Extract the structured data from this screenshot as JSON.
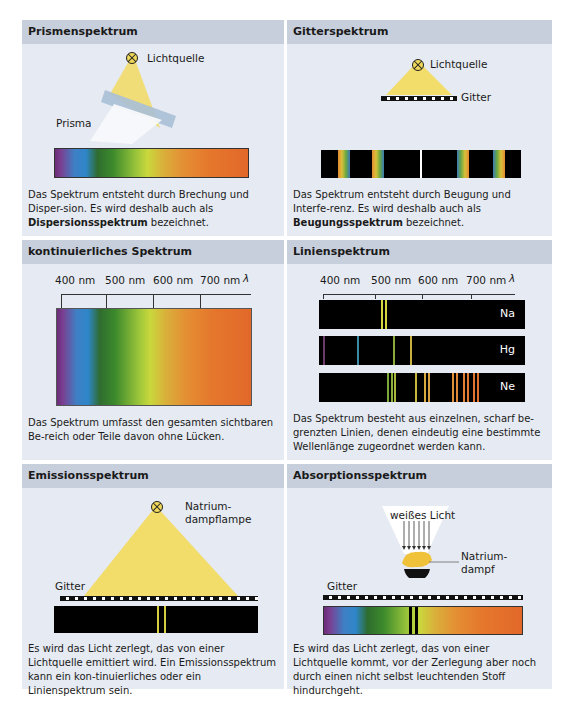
{
  "panels": {
    "prism": {
      "title": "Prismenspektrum",
      "light_label": "Lichtquelle",
      "prism_label": "Prisma",
      "desc_1": "Das Spektrum entsteht durch Brechung und Disper-sion. Es wird deshalb auch als ",
      "desc_bold": "Dispersionsspektrum",
      "desc_2": " bezeichnet."
    },
    "grating": {
      "title": "Gitterspektrum",
      "light_label": "Lichtquelle",
      "grating_label": "Gitter",
      "desc_1": "Das Spektrum entsteht durch Beugung und Interfe-renz. Es wird deshalb auch als ",
      "desc_bold": "Beugungsspektrum",
      "desc_2": " bezeichnet."
    },
    "continuous": {
      "title": "kontinuierliches Spektrum",
      "axis_labels": [
        "400 nm",
        "500 nm",
        "600 nm",
        "700 nm"
      ],
      "axis_symbol": "λ",
      "desc": "Das Spektrum umfasst den gesamten sichtbaren Be-reich oder Teile davon ohne Lücken."
    },
    "line": {
      "title": "Linienspektrum",
      "axis_labels": [
        "400 nm",
        "500 nm",
        "600 nm",
        "700 nm"
      ],
      "axis_symbol": "λ",
      "elements": [
        {
          "symbol": "Na",
          "lines": [
            {
              "x": 94,
              "color": "#d6d640"
            },
            {
              "x": 98,
              "color": "#d6d640"
            }
          ]
        },
        {
          "symbol": "Hg",
          "lines": [
            {
              "x": 4,
              "color": "#6a3a6a"
            },
            {
              "x": 38,
              "color": "#3a8aa8"
            },
            {
              "x": 74,
              "color": "#8aaa3a"
            },
            {
              "x": 91,
              "color": "#c8b040"
            }
          ]
        },
        {
          "symbol": "Ne",
          "lines": [
            {
              "x": 68,
              "color": "#7aa83a"
            },
            {
              "x": 72,
              "color": "#8ab03a"
            },
            {
              "x": 75,
              "color": "#a8b83a"
            },
            {
              "x": 96,
              "color": "#c8b840"
            },
            {
              "x": 105,
              "color": "#d8a840"
            },
            {
              "x": 109,
              "color": "#d8a040"
            },
            {
              "x": 133,
              "color": "#e09038"
            },
            {
              "x": 137,
              "color": "#e08838"
            },
            {
              "x": 144,
              "color": "#e08034"
            },
            {
              "x": 148,
              "color": "#e07a32"
            },
            {
              "x": 154,
              "color": "#e07430"
            },
            {
              "x": 158,
              "color": "#e06c2e"
            }
          ]
        }
      ],
      "desc": "Das Spektrum besteht aus einzelnen, scharf be-grenzten Linien, denen eindeutig eine bestimmte Wellenlänge zugeordnet werden kann."
    },
    "emission": {
      "title": "Emissionsspektrum",
      "lamp_label_1": "Natrium-",
      "lamp_label_2": "dampflampe",
      "grating_label": "Gitter",
      "desc": "Es wird das Licht zerlegt, das von einer Lichtquelle emittiert wird. Ein Emissionsspektrum kann ein kon-tinuierliches oder ein Linienspektrum sein."
    },
    "absorption": {
      "title": "Absorptionsspektrum",
      "white_light_label": "weißes Licht",
      "vapor_label_1": "Natrium-",
      "vapor_label_2": "dampf",
      "grating_label": "Gitter",
      "desc": "Es wird das Licht zerlegt, das von einer Lichtquelle kommt, vor der Zerlegung aber noch durch einen nicht selbst leuchtenden Stoff hindurchgeht."
    }
  },
  "colors": {
    "header_bg": "#c8cfdc",
    "panel_bg": "#e6eaf2",
    "light_yellow": "#f2dc6a"
  }
}
